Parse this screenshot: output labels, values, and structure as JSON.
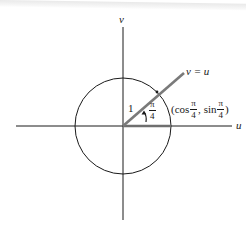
{
  "figure": {
    "axes": {
      "horizontal_label": "u",
      "vertical_label": "v"
    },
    "circle": {
      "radius_label": "1"
    },
    "line": {
      "label": "v = u"
    },
    "angle": {
      "numerator": "π",
      "denominator": "4"
    },
    "point": {
      "open_paren": "(",
      "cos_fn": "cos",
      "cos_num": "π",
      "cos_den": "4",
      "separator": ",",
      "sin_fn": "sin",
      "sin_num": "π",
      "sin_den": "4",
      "close_paren": ")"
    },
    "colors": {
      "ink": "#1a1a1a",
      "ray": "#7a7a7a",
      "background": "#ffffff"
    }
  }
}
